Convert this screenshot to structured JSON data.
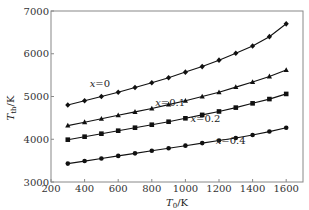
{
  "chart_data": {
    "type": "line",
    "title": "",
    "xlabel": "T0/K",
    "ylabel": "Tth/K",
    "xlim": [
      200,
      1700
    ],
    "ylim": [
      3000,
      7000
    ],
    "xticks": [
      200,
      400,
      600,
      800,
      1000,
      1200,
      1400,
      1600
    ],
    "yticks": [
      3000,
      4000,
      5000,
      6000,
      7000
    ],
    "grid": false,
    "legend": "inline labels",
    "x": [
      300,
      400,
      500,
      600,
      700,
      800,
      900,
      1000,
      1100,
      1200,
      1300,
      1400,
      1500,
      1600
    ],
    "series": [
      {
        "name": "x=0",
        "marker": "diamond",
        "values": [
          4800,
          4900,
          5000,
          5100,
          5210,
          5320,
          5440,
          5570,
          5700,
          5850,
          6010,
          6180,
          6400,
          6700
        ]
      },
      {
        "name": "x=0.1",
        "marker": "triangle",
        "values": [
          4320,
          4400,
          4480,
          4560,
          4640,
          4720,
          4810,
          4900,
          5000,
          5100,
          5220,
          5340,
          5470,
          5620
        ]
      },
      {
        "name": "x=0.2",
        "marker": "square",
        "values": [
          3990,
          4060,
          4130,
          4200,
          4270,
          4340,
          4410,
          4490,
          4570,
          4650,
          4740,
          4840,
          4940,
          5060
        ]
      },
      {
        "name": "x=0.4",
        "marker": "circle",
        "values": [
          3430,
          3490,
          3550,
          3610,
          3670,
          3730,
          3790,
          3850,
          3910,
          3970,
          4030,
          4100,
          4180,
          4270
        ]
      }
    ],
    "annotations": [
      {
        "text": "x=0",
        "x": 430,
        "y": 5220
      },
      {
        "text": "x=0.1",
        "x": 820,
        "y": 4780
      },
      {
        "text": "x=0.2",
        "x": 1030,
        "y": 4400
      },
      {
        "text": "x=0.4",
        "x": 1180,
        "y": 3880
      }
    ]
  },
  "axes": {
    "ylabel_main": "T",
    "ylabel_sub": "th",
    "ylabel_unit": "/K",
    "xlabel_main": "T",
    "xlabel_sub": "0",
    "xlabel_unit": "/K"
  }
}
